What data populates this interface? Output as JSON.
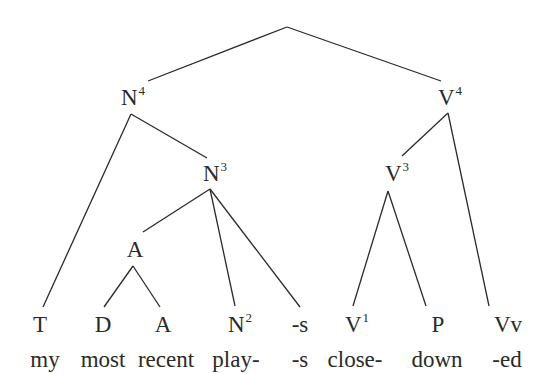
{
  "diagram": {
    "type": "syntax-tree",
    "nodes": {
      "n4": {
        "base": "N",
        "sup": "4"
      },
      "v4": {
        "base": "V",
        "sup": "4"
      },
      "n3": {
        "base": "N",
        "sup": "3"
      },
      "v3": {
        "base": "V",
        "sup": "3"
      },
      "a_mid": {
        "base": "A",
        "sup": ""
      }
    },
    "leaves": [
      {
        "base": "T",
        "sup": "",
        "word": "my"
      },
      {
        "base": "D",
        "sup": "",
        "word": "most"
      },
      {
        "base": "A",
        "sup": "",
        "word": "recent"
      },
      {
        "base": "N",
        "sup": "2",
        "word": "play-"
      },
      {
        "base": "-s",
        "sup": "",
        "word": "-s"
      },
      {
        "base": "V",
        "sup": "1",
        "word": "close-"
      },
      {
        "base": "P",
        "sup": "",
        "word": "down"
      },
      {
        "base": "Vv",
        "sup": "",
        "word": "-ed"
      }
    ],
    "line_color": "#2a2a2a"
  }
}
